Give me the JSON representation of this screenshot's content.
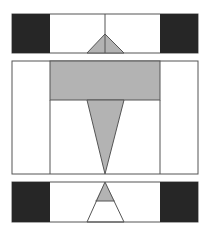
{
  "diagram": {
    "colors": {
      "dark": "#262626",
      "gray": "#b3b3b3",
      "line": "#555555",
      "background": "#ffffff"
    },
    "panels": [
      {
        "id": "top-panel",
        "box": [
          12,
          14,
          198,
          53
        ],
        "dark_blocks": [
          [
            12,
            14,
            50,
            53
          ],
          [
            160,
            14,
            198,
            53
          ]
        ],
        "inner_lines_x": [
          50,
          160
        ],
        "center_line": [
          105,
          14,
          105,
          53
        ],
        "triangle": [
          [
            105,
            34
          ],
          [
            87,
            53
          ],
          [
            124,
            53
          ]
        ]
      },
      {
        "id": "middle-panel",
        "box": [
          12,
          61,
          198,
          174
        ],
        "inner_lines_x": [
          50,
          160
        ],
        "gray_rect": [
          50,
          61,
          160,
          100
        ],
        "triangle": [
          [
            87,
            100
          ],
          [
            124,
            100
          ],
          [
            105,
            174
          ]
        ]
      },
      {
        "id": "bottom-panel",
        "box": [
          12,
          182,
          198,
          222
        ],
        "dark_blocks": [
          [
            12,
            182,
            50,
            222
          ],
          [
            160,
            182,
            198,
            222
          ]
        ],
        "triangle": [
          [
            105,
            182
          ],
          [
            87,
            222
          ],
          [
            124,
            222
          ]
        ],
        "gray_tip_bottom_y": 201
      }
    ]
  }
}
